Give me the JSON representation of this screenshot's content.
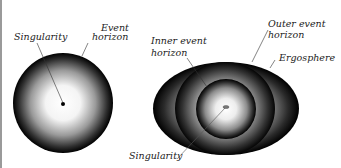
{
  "figure": {
    "colors": {
      "background": "#ffffff",
      "edge_line": "#9a9a9a",
      "sphere_center": "#ffffff",
      "sphere_edge": "#000000",
      "label_text": "#222222"
    },
    "schwarzschild": {
      "labels": {
        "singularity": "Singularity",
        "event_line1": "Event",
        "event_line2": "horizon"
      }
    },
    "kerr": {
      "labels": {
        "inner_line1": "Inner event",
        "inner_line2": "horizon",
        "outer_line1": "Outer event",
        "outer_line2": "horizon",
        "ergosphere": "Ergosphere",
        "singularity": "Singularity"
      }
    }
  }
}
